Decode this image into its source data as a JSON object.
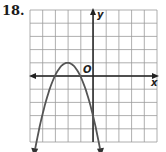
{
  "problem": {
    "number": "18."
  },
  "graph": {
    "x_axis_label": "x",
    "y_axis_label": "y",
    "origin_label": "O",
    "grid": {
      "columns": 10,
      "rows": 10,
      "x_min": -5,
      "x_max": 5,
      "y_min": -5,
      "y_max": 5
    },
    "colors": {
      "grid": "#9a9a9a",
      "axis": "#222222",
      "curve": "#555555",
      "border": "#bbbbbb"
    }
  },
  "chart_data": {
    "type": "line",
    "title": "",
    "xlabel": "x",
    "ylabel": "y",
    "xlim": [
      -5,
      5
    ],
    "ylim": [
      -5,
      5
    ],
    "grid": true,
    "series": [
      {
        "name": "parabola y = -(x+2)^2 + 1",
        "vertex": [
          -2,
          1
        ],
        "x_intercepts": [
          -3,
          -1
        ],
        "opens": "down",
        "x": [
          -4.6,
          -4,
          -3.5,
          -3,
          -2.5,
          -2,
          -1.5,
          -1,
          -0.5,
          0.4
        ],
        "y": [
          -5.76,
          -3,
          -1.25,
          0,
          0.75,
          1,
          0.75,
          0,
          -1.25,
          -4.76
        ]
      }
    ]
  }
}
